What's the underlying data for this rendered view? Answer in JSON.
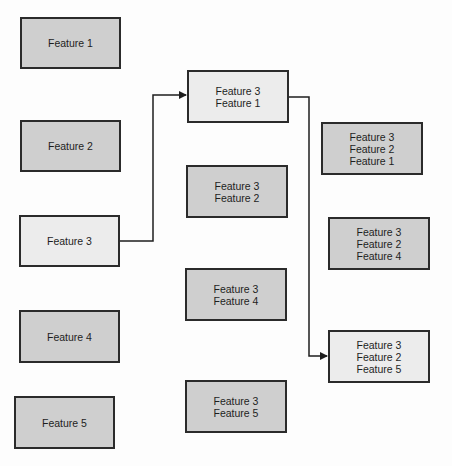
{
  "diagram": {
    "type": "feature-selection-tree",
    "colors": {
      "unselected_fill": "#cfcfcf",
      "selected_fill": "#ececec",
      "border": "#2b2b2b",
      "connector": "#1e1e1e"
    },
    "columns": [
      {
        "level": 1,
        "nodes": [
          {
            "id": "f1",
            "lines": [
              "Feature 1"
            ],
            "selected": false
          },
          {
            "id": "f2",
            "lines": [
              "Feature 2"
            ],
            "selected": false
          },
          {
            "id": "f3",
            "lines": [
              "Feature 3"
            ],
            "selected": true
          },
          {
            "id": "f4",
            "lines": [
              "Feature 4"
            ],
            "selected": false
          },
          {
            "id": "f5",
            "lines": [
              "Feature 5"
            ],
            "selected": false
          }
        ]
      },
      {
        "level": 2,
        "nodes": [
          {
            "id": "f31",
            "lines": [
              "Feature 3",
              "Feature 1"
            ],
            "selected": true
          },
          {
            "id": "f32",
            "lines": [
              "Feature 3",
              "Feature 2"
            ],
            "selected": false
          },
          {
            "id": "f34",
            "lines": [
              "Feature 3",
              "Feature 4"
            ],
            "selected": false
          },
          {
            "id": "f35",
            "lines": [
              "Feature 3",
              "Feature 5"
            ],
            "selected": false
          }
        ]
      },
      {
        "level": 3,
        "nodes": [
          {
            "id": "f321",
            "lines": [
              "Feature 3",
              "Feature 2",
              "Feature 1"
            ],
            "selected": false
          },
          {
            "id": "f324",
            "lines": [
              "Feature 3",
              "Feature 2",
              "Feature 4"
            ],
            "selected": false
          },
          {
            "id": "f325",
            "lines": [
              "Feature 3",
              "Feature 2",
              "Feature 5"
            ],
            "selected": true
          }
        ]
      }
    ],
    "edges": [
      {
        "from": "f3",
        "to": "f31",
        "arrow": true
      },
      {
        "from": "f31",
        "to": "f325",
        "arrow": true
      }
    ]
  }
}
